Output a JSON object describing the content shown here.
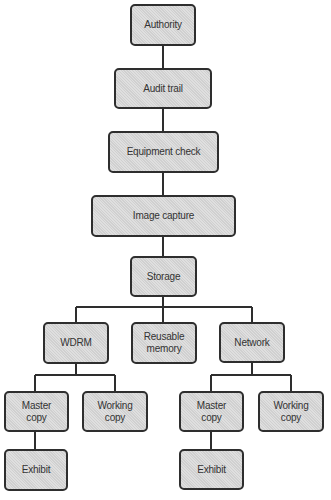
{
  "diagram": {
    "type": "flowchart-tree",
    "colors": {
      "node_fill": "#d8d8d8",
      "node_border": "#2e2e2e",
      "text": "#333333",
      "connector": "#2e2e2e",
      "background": "#ffffff"
    },
    "nodes": {
      "authority": {
        "label": "Authority"
      },
      "audit_trail": {
        "label": "Audit trail"
      },
      "equipment_check": {
        "label": "Equipment check"
      },
      "image_capture": {
        "label": "Image capture"
      },
      "storage": {
        "label": "Storage"
      },
      "wdrm": {
        "label": "WDRM"
      },
      "reusable_memory": {
        "label": "Reusable\nmemory"
      },
      "network": {
        "label": "Network"
      },
      "wdrm_master_copy": {
        "label": "Master\ncopy"
      },
      "wdrm_working_copy": {
        "label": "Working\ncopy"
      },
      "wdrm_exhibit": {
        "label": "Exhibit"
      },
      "network_master_copy": {
        "label": "Master\ncopy"
      },
      "network_working_copy": {
        "label": "Working\ncopy"
      },
      "network_exhibit": {
        "label": "Exhibit"
      }
    },
    "edges": [
      [
        "Authority",
        "Audit trail"
      ],
      [
        "Audit trail",
        "Equipment check"
      ],
      [
        "Equipment check",
        "Image capture"
      ],
      [
        "Image capture",
        "Storage"
      ],
      [
        "Storage",
        "WDRM"
      ],
      [
        "Storage",
        "Reusable memory"
      ],
      [
        "Storage",
        "Network"
      ],
      [
        "WDRM",
        "Master copy"
      ],
      [
        "WDRM",
        "Working copy"
      ],
      [
        "Master copy",
        "Exhibit"
      ],
      [
        "Network",
        "Master copy"
      ],
      [
        "Network",
        "Working copy"
      ],
      [
        "Master copy",
        "Exhibit"
      ]
    ]
  }
}
